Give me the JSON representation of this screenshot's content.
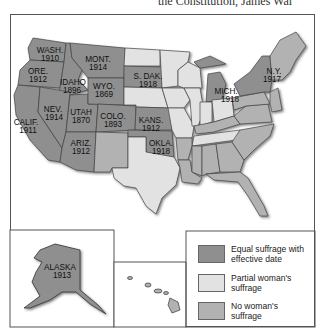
{
  "header": {
    "partial_text": "the Constitution, James Wal"
  },
  "colors": {
    "equal": "#8f8f8f",
    "partial": "#e2e2e2",
    "none": "#b2b2b2",
    "border": "#444444"
  },
  "states_labeled": [
    {
      "name": "WASH.",
      "year": "1910"
    },
    {
      "name": "ORE.",
      "year": "1912"
    },
    {
      "name": "CALIF.",
      "year": "1911"
    },
    {
      "name": "IDAHO",
      "year": "1896"
    },
    {
      "name": "NEV.",
      "year": "1914"
    },
    {
      "name": "UTAH",
      "year": "1870"
    },
    {
      "name": "ARIZ.",
      "year": "1912"
    },
    {
      "name": "MONT.",
      "year": "1914"
    },
    {
      "name": "WYO.",
      "year": "1869"
    },
    {
      "name": "COLO.",
      "year": "1893"
    },
    {
      "name": "S. DAK.",
      "year": "1918"
    },
    {
      "name": "KANS.",
      "year": "1912"
    },
    {
      "name": "OKLA.",
      "year": "1918"
    },
    {
      "name": "MICH.",
      "year": "1918"
    },
    {
      "name": "N.Y.",
      "year": "1917"
    },
    {
      "name": "ALASKA",
      "year": "1913"
    }
  ],
  "legend": {
    "items": [
      {
        "label": "Equal suffrage with effective date",
        "category": "equal"
      },
      {
        "label": "Partial woman's suffrage",
        "category": "partial"
      },
      {
        "label": "No woman's suffrage",
        "category": "none"
      }
    ]
  },
  "insets": [
    "alaska",
    "hawaii"
  ]
}
